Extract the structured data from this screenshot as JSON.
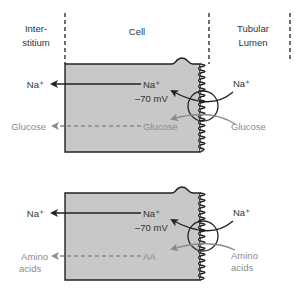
{
  "figure": {
    "region_labels": {
      "interstitium_line1": "Inter-",
      "interstitium_line2": "stitium",
      "cell": "Cell",
      "lumen_line1": "Tubular",
      "lumen_line2": "Lumen"
    },
    "colors": {
      "cell_fill": "#c8c8c8",
      "outline": "#222222",
      "substrate": "#8a8a8a"
    },
    "panels": [
      {
        "na_interstitium": "Na⁺",
        "na_cell": "Na⁺",
        "membrane_potential": "–70 mV",
        "na_lumen": "Na⁺",
        "substrate_interstitium_line1": "Glucose",
        "substrate_interstitium_line2": "",
        "substrate_cell": "Glucose",
        "substrate_lumen_line1": "Glucose",
        "substrate_lumen_line2": ""
      },
      {
        "na_interstitium": "Na⁺",
        "na_cell": "Na⁺",
        "membrane_potential": "–70 mV",
        "na_lumen": "Na⁺",
        "substrate_interstitium_line1": "Amino",
        "substrate_interstitium_line2": "acids",
        "substrate_cell": "AA",
        "substrate_lumen_line1": "Amino",
        "substrate_lumen_line2": "acids"
      }
    ]
  }
}
